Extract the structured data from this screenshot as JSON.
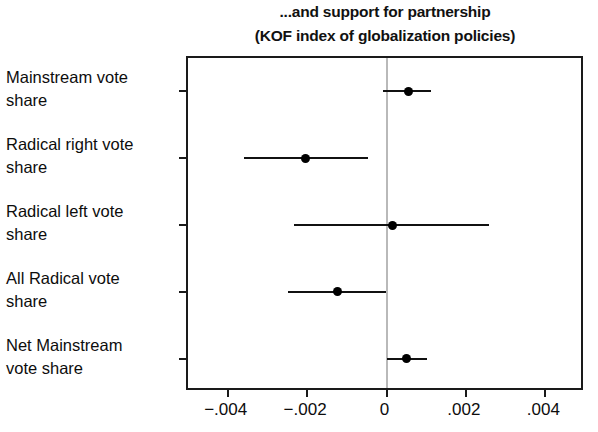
{
  "chart_data": {
    "type": "scatter",
    "title": "...and support for partnership",
    "subtitle": "(KOF index of globalization policies)",
    "orientation": "horizontal",
    "xlabel": "",
    "ylabel": "",
    "xlim": [
      -0.005,
      0.005
    ],
    "grid": false,
    "legend": null,
    "zero_reference_line": 0,
    "x_ticks": [
      -0.004,
      -0.002,
      0,
      0.002,
      0.004
    ],
    "x_tick_labels": [
      "-.004",
      "-.002",
      "0",
      ".002",
      ".004"
    ],
    "categories": [
      "Mainstream vote share",
      "Radical right vote share",
      "Radical left vote share",
      "All Radical vote share",
      "Net Mainstream vote share"
    ],
    "category_lines": [
      [
        "Mainstream vote",
        "share"
      ],
      [
        "Radical right vote",
        "share"
      ],
      [
        "Radical left vote",
        "share"
      ],
      [
        "All Radical vote",
        "share"
      ],
      [
        "Net Mainstream",
        "vote share"
      ]
    ],
    "values": [
      0.00055,
      -0.00204,
      0.00015,
      -0.00124,
      0.0005
    ],
    "ci_lower": [
      -8e-05,
      -0.00358,
      -0.00232,
      -0.00248,
      0.0
    ],
    "ci_upper": [
      0.00112,
      -0.00046,
      0.00257,
      0.0,
      0.00101
    ],
    "point_color": "#000000",
    "line_color": "#111111",
    "zero_line_color": "#b9b9b9"
  }
}
